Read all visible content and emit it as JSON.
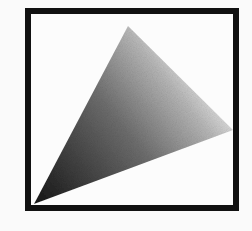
{
  "figure": {
    "frame": {
      "x": 25,
      "y": 8,
      "width": 214,
      "height": 203,
      "border_width": 6,
      "border_color": "#111111"
    },
    "wedge": {
      "points": [
        [
          34,
          204
        ],
        [
          128,
          26
        ],
        [
          233,
          130
        ]
      ],
      "gradient_start_color": "#1a1a1a",
      "gradient_end_color": "#e8e8e8"
    }
  }
}
